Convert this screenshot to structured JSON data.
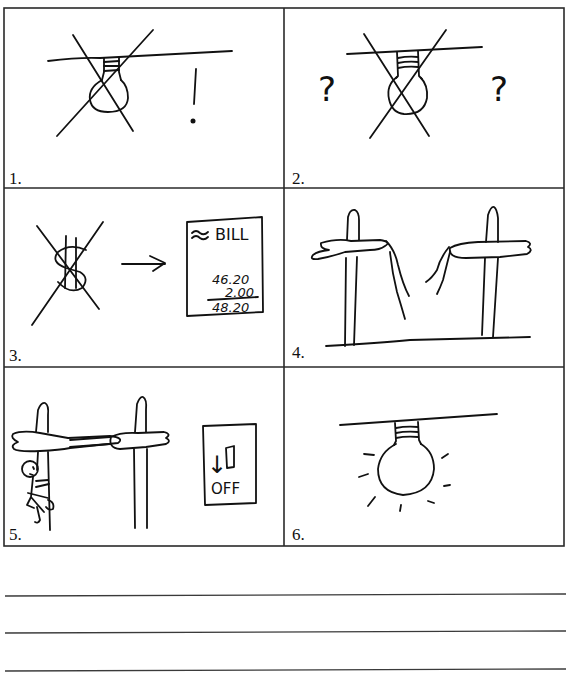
{
  "worksheet": {
    "panels": [
      {
        "number": "1.",
        "label": "1.",
        "description": "crossed-out unlit light bulb with exclamation mark",
        "glyphs": {
          "exclaim": "!"
        }
      },
      {
        "number": "2.",
        "label": "2.",
        "description": "crossed-out unlit light bulb with question marks",
        "glyphs": {
          "question_left": "?",
          "question_right": "?"
        }
      },
      {
        "number": "3.",
        "label": "3.",
        "description": "crossed-out dollar sign, arrow to bill",
        "bill": {
          "title": "BILL",
          "line1": "46.20",
          "line2": "2.00",
          "total": "48.20"
        },
        "glyphs": {
          "dollar": "$",
          "approx": "≈"
        }
      },
      {
        "number": "4.",
        "label": "4.",
        "description": "two utility poles with broken power line"
      },
      {
        "number": "5.",
        "label": "5.",
        "description": "worker climbing pole repairing line, switch off",
        "switch": {
          "state_label": "OFF",
          "arrow": "↓"
        }
      },
      {
        "number": "6.",
        "label": "6.",
        "description": "lit light bulb shining"
      }
    ],
    "writing_lines": 3
  },
  "colors": {
    "ink": "#111111",
    "frame": "#2a2a2a",
    "paper": "#ffffff"
  }
}
